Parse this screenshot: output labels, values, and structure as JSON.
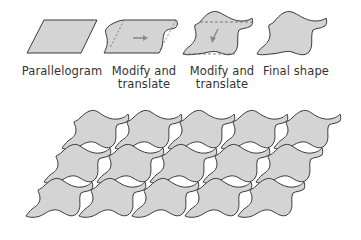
{
  "steps": [
    {
      "label_line1": "Parallelogram",
      "label_line2": ""
    },
    {
      "label_line1": "Modify and",
      "label_line2": "translate"
    },
    {
      "label_line1": "Modify and",
      "label_line2": "translate"
    },
    {
      "label_line1": "Final shape",
      "label_line2": ""
    }
  ],
  "tessellation": {
    "rows": 3,
    "columns": 5
  },
  "colors": {
    "fill": "#d4d4d4",
    "stroke": "#3a3a3a",
    "dashed": "#666666",
    "arrow": "#8a8a8a"
  }
}
